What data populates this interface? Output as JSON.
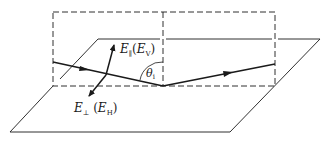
{
  "diagram": {
    "type": "reflection-geometry",
    "colors": {
      "line": "#1a1a1a",
      "background": "#ffffff"
    },
    "labels": {
      "e_parallel": {
        "symbol": "E",
        "subscript": "∥",
        "paren_symbol": "E",
        "paren_subscript": "V"
      },
      "e_perp": {
        "symbol": "E",
        "subscript": "⊥",
        "paren_symbol": "E",
        "paren_subscript": "H"
      },
      "angle": {
        "symbol": "θ",
        "subscript": "i"
      }
    },
    "elements": [
      "plane-of-incidence (dashed rectangle)",
      "reflecting surface (parallelogram)",
      "incident ray",
      "reflected ray",
      "E-parallel vector",
      "E-perpendicular vector",
      "incidence angle arc"
    ]
  }
}
